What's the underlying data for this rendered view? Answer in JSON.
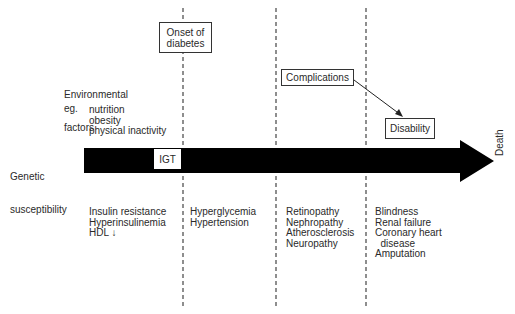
{
  "diagram": {
    "type": "timeline-arrow",
    "colors": {
      "arrow": "#000000",
      "text": "#2a2a2a",
      "box_border": "#333333",
      "dashed_line": "#444444"
    },
    "boxes": {
      "onset": [
        "Onset of",
        "diabetes"
      ],
      "igt": "IGT",
      "complications": "Complications",
      "disability": "Disability"
    },
    "environmental": {
      "title": [
        "Environmental",
        "factors"
      ],
      "eg_label": "eg.",
      "items": [
        "nutrition",
        "obesity",
        "physical inactivity"
      ]
    },
    "genetic": [
      "Genetic",
      "susceptibility"
    ],
    "death_label": "Death",
    "stages": [
      {
        "items": [
          "Insulin resistance",
          "Hyperinsulinemia",
          "HDL"
        ],
        "hdl_arrow": "↓"
      },
      {
        "items": [
          "Hyperglycemia",
          "Hypertension"
        ]
      },
      {
        "items": [
          "Retinopathy",
          "Nephropathy",
          "Atherosclerosis",
          "Neuropathy"
        ]
      },
      {
        "items": [
          "Blindness",
          "Renal failure",
          "Coronary heart",
          "  disease",
          "Amputation"
        ]
      }
    ],
    "dividers_x": [
      183,
      276,
      366
    ]
  }
}
